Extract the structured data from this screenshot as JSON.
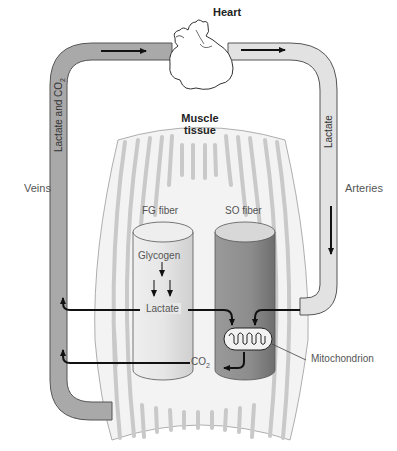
{
  "labels": {
    "heart": "Heart",
    "muscle_tissue_line1": "Muscle",
    "muscle_tissue_line2": "tissue",
    "veins": "Veins",
    "arteries": "Arteries",
    "vein_vessel": "Lactate and CO",
    "vein_vessel_sub": "2",
    "artery_vessel": "Lactate",
    "fg_fiber": "FG fiber",
    "so_fiber": "SO fiber",
    "glycogen": "Glycogen",
    "lactate": "Lactate",
    "co2": "CO",
    "co2_sub": "2",
    "mitochondrion": "Mitochondrion"
  },
  "colors": {
    "vein_fill": "#a9a9a9",
    "artery_fill": "#e0e0e0",
    "vessel_stroke": "#555555",
    "fg_fiber_fill": "#e6e6e6",
    "so_fiber_fill": "#8f8f8f",
    "muscle_stripe": "#c8c8c8",
    "arrow": "#111111",
    "text": "#555555"
  }
}
